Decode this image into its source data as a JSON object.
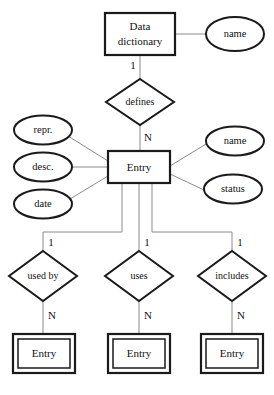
{
  "diagram": {
    "type": "entity-relationship",
    "stroke_color": "#1a1a1a",
    "connector_color": "#8a8a8a",
    "background_color": "#ffffff"
  },
  "entities": {
    "data_dictionary": {
      "label_line1": "Data",
      "label_line2": "dictionary"
    },
    "entry": {
      "label": "Entry"
    },
    "weak_entry_left": {
      "label": "Entry"
    },
    "weak_entry_middle": {
      "label": "Entry"
    },
    "weak_entry_right": {
      "label": "Entry"
    }
  },
  "relationships": {
    "defines": {
      "label": "defines"
    },
    "used_by": {
      "label": "used by"
    },
    "uses": {
      "label": "uses"
    },
    "includes": {
      "label": "includes"
    }
  },
  "attributes": {
    "dictionary_name": {
      "label": "name"
    },
    "entry_repr": {
      "label": "repr."
    },
    "entry_desc": {
      "label": "desc."
    },
    "entry_date": {
      "label": "date"
    },
    "entry_name": {
      "label": "name"
    },
    "entry_status": {
      "label": "status"
    }
  },
  "cardinalities": {
    "defines_top": "1",
    "defines_bottom": "N",
    "used_by_top": "1",
    "used_by_bottom": "N",
    "uses_top": "1",
    "uses_bottom": "N",
    "includes_top": "1",
    "includes_bottom": "N"
  }
}
